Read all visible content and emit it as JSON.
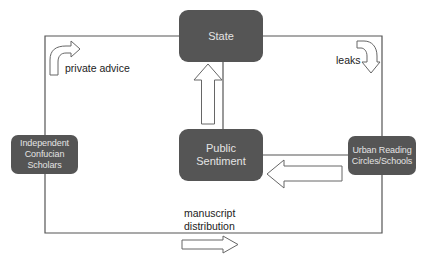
{
  "diagram": {
    "type": "flow",
    "colors": {
      "node_fill": "#555555",
      "node_text": "#e4e4e4",
      "line": "#555555",
      "arrow_fill": "#ffffff",
      "arrow_stroke": "#666666",
      "label_text": "#222222"
    },
    "nodes": {
      "state": {
        "label": "State"
      },
      "public_sentiment": {
        "label_line1": "Public",
        "label_line2": "Sentiment"
      },
      "independent_scholars": {
        "label_line1": "Independent",
        "label_line2": "Confucian",
        "label_line3": "Scholars"
      },
      "urban_reading": {
        "label_line1": "Urban Reading",
        "label_line2": "Circles/Schools"
      }
    },
    "edges": [
      {
        "from": "independent_scholars",
        "to": "state",
        "label": "private advice"
      },
      {
        "from": "state",
        "to": "urban_reading",
        "label": "leaks"
      },
      {
        "from": "public_sentiment",
        "to": "state",
        "label": ""
      },
      {
        "from": "urban_reading",
        "to": "public_sentiment",
        "label": ""
      },
      {
        "from": "independent_scholars",
        "to": "urban_reading",
        "label": "manuscript distribution"
      }
    ],
    "labels": {
      "private_advice": "private advice",
      "leaks": "leaks",
      "manuscript_line1": "manuscript",
      "manuscript_line2": "distribution"
    }
  }
}
